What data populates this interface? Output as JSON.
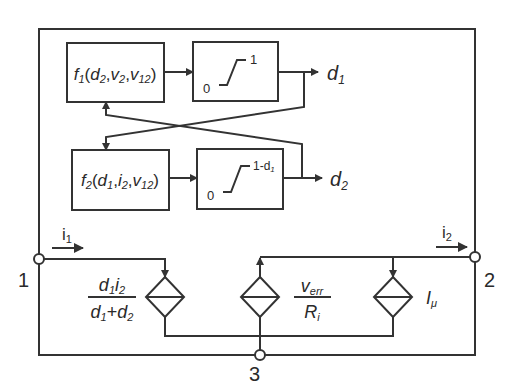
{
  "diagram": {
    "type": "block-diagram with equivalent circuit",
    "colors": {
      "stroke": "#333333",
      "background": "#ffffff",
      "text": "#2a2a2a"
    },
    "blocks": {
      "f1": {
        "name": "f",
        "sub": "1",
        "args": [
          "d2",
          "v2",
          "v12"
        ]
      },
      "f2": {
        "name": "f",
        "sub": "2",
        "args": [
          "d1",
          "i2",
          "v12"
        ]
      },
      "sat1": {
        "low": "0",
        "high": "1"
      },
      "sat2": {
        "low": "0",
        "high": "1-d",
        "high_sub": "1"
      }
    },
    "outputs": {
      "d1": {
        "base": "d",
        "sub": "1"
      },
      "d2": {
        "base": "d",
        "sub": "2"
      }
    },
    "nodes": {
      "n1": "1",
      "n2": "2",
      "n3": "3"
    },
    "currents": {
      "i1": {
        "base": "i",
        "sub": "1"
      },
      "i2": {
        "base": "i",
        "sub": "2"
      }
    },
    "sources": {
      "left": {
        "numerator": "d1i2",
        "denominator": "d1+d2"
      },
      "middle": {
        "numerator_base": "v",
        "numerator_sub": "err",
        "denominator_base": "R",
        "denominator_sub": "i"
      },
      "right": {
        "base": "I",
        "sub": "μ"
      }
    },
    "text": {
      "f": "f",
      "open": "(",
      "close": ")",
      "comma": ",",
      "d": "d",
      "v": "v",
      "i": "i",
      "one": "1",
      "two": "2",
      "twelve": "12",
      "plus": "+",
      "err": "err",
      "R": "R",
      "i_sub": "i",
      "I": "I",
      "mu": "μ",
      "sat_zero": "0",
      "sat1_high": "1",
      "sat2_high": "1-d",
      "sat2_high_sub": "1"
    }
  }
}
